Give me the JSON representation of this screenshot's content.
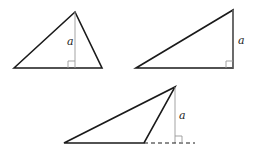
{
  "diagram": {
    "colors": {
      "line": "#1a1a1a",
      "altitude": "#999999"
    },
    "triangles": [
      {
        "id": "acute",
        "label": "a"
      },
      {
        "id": "right",
        "label": "a"
      },
      {
        "id": "obtuse",
        "label": "a"
      }
    ]
  }
}
